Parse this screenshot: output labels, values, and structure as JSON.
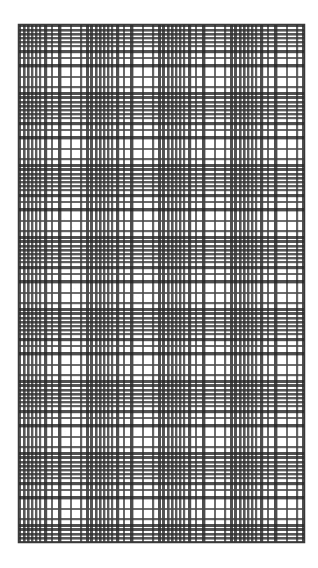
{
  "document": {
    "title": "Tartan Plaid Swatch",
    "kind": "scanned-textile-pattern",
    "background_color": "#ffffff",
    "ink_color": "#2b2b2b"
  },
  "swatch": {
    "name": "plaid-swatch",
    "left": 18,
    "top": 24,
    "right": 305,
    "bottom": 543,
    "width": 287,
    "height": 519,
    "border_color": "#3a3a3a",
    "border_width": 1.5,
    "paper_color": "#ffffff",
    "thread_color": "#2e2e2e",
    "thread_color_light": "#6e6e6e",
    "overprint_color": "#1a1a1a"
  },
  "chart_data": {
    "type": "heatmap",
    "xlabel": "",
    "ylabel": "",
    "grid": true,
    "legend": "none",
    "warp_repeat_px": 72,
    "weft_repeat_px": 72,
    "warp_sett": [
      {
        "offset": 0,
        "width": 3.0,
        "shade": "#2a2a2a"
      },
      {
        "offset": 5,
        "width": 2.6,
        "shade": "#2e2e2e"
      },
      {
        "offset": 9,
        "width": 2.6,
        "shade": "#2e2e2e"
      },
      {
        "offset": 13,
        "width": 2.4,
        "shade": "#333333"
      },
      {
        "offset": 17,
        "width": 2.4,
        "shade": "#333333"
      },
      {
        "offset": 21,
        "width": 2.2,
        "shade": "#3a3a3a"
      },
      {
        "offset": 26,
        "width": 3.2,
        "shade": "#242424"
      },
      {
        "offset": 33,
        "width": 2.0,
        "shade": "#444444"
      },
      {
        "offset": 40,
        "width": 3.4,
        "shade": "#222222"
      },
      {
        "offset": 52,
        "width": 2.0,
        "shade": "#4a4a4a"
      },
      {
        "offset": 62,
        "width": 2.2,
        "shade": "#3d3d3d"
      },
      {
        "offset": 68,
        "width": 3.0,
        "shade": "#262626"
      }
    ],
    "weft_sett": [
      {
        "offset": 0,
        "width": 3.0,
        "shade": "#2a2a2a"
      },
      {
        "offset": 5,
        "width": 2.6,
        "shade": "#2e2e2e"
      },
      {
        "offset": 9,
        "width": 2.6,
        "shade": "#2e2e2e"
      },
      {
        "offset": 13,
        "width": 2.4,
        "shade": "#333333"
      },
      {
        "offset": 17,
        "width": 2.4,
        "shade": "#333333"
      },
      {
        "offset": 21,
        "width": 2.2,
        "shade": "#3a3a3a"
      },
      {
        "offset": 26,
        "width": 3.2,
        "shade": "#242424"
      },
      {
        "offset": 33,
        "width": 2.0,
        "shade": "#444444"
      },
      {
        "offset": 40,
        "width": 3.4,
        "shade": "#222222"
      },
      {
        "offset": 52,
        "width": 2.0,
        "shade": "#4a4a4a"
      },
      {
        "offset": 62,
        "width": 2.2,
        "shade": "#3d3d3d"
      },
      {
        "offset": 68,
        "width": 3.0,
        "shade": "#262626"
      }
    ],
    "dense_band_rows_px": [
      24,
      96,
      168,
      240,
      312,
      384,
      456,
      528
    ],
    "dense_band_cols_px": [
      18,
      90,
      162,
      234,
      306
    ]
  }
}
